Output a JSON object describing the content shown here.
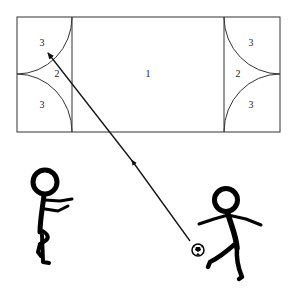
{
  "diagram": {
    "field": {
      "zone_labels": {
        "center": "1",
        "left_middle": "2",
        "left_top": "3",
        "left_bottom": "3",
        "right_middle": "2",
        "right_top": "3",
        "right_bottom": "3"
      }
    },
    "colors": {
      "line": "#333333",
      "figure": "#000000",
      "background": "#ffffff"
    },
    "elements": [
      {
        "name": "playing-field",
        "type": "rectangle"
      },
      {
        "name": "kick-trajectory-arrow",
        "type": "arrow",
        "from": "ball",
        "to": "left-zone-3-top"
      },
      {
        "name": "ball",
        "type": "soccer-ball"
      },
      {
        "name": "kicking-player",
        "type": "stick-figure"
      },
      {
        "name": "watching-player",
        "type": "stick-figure"
      }
    ]
  }
}
